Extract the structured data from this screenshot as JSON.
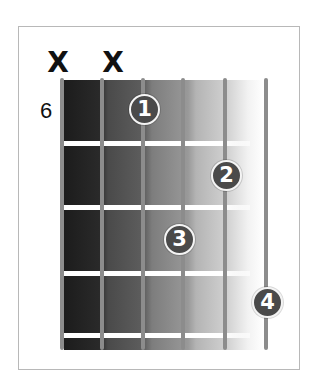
{
  "diagram": {
    "type": "guitar-chord-diagram",
    "starting_fret": "6",
    "string_count": 6,
    "fret_count": 4,
    "muted_strings": [
      {
        "string": 6,
        "symbol": "X"
      },
      {
        "string": 5,
        "symbol": "X"
      }
    ],
    "fingers": [
      {
        "finger": "1",
        "string": 4,
        "fret": 1
      },
      {
        "finger": "2",
        "string": 2,
        "fret": 2
      },
      {
        "finger": "3",
        "string": 3,
        "fret": 3
      },
      {
        "finger": "4",
        "string": 1,
        "fret": 4
      }
    ],
    "colors": {
      "string": "#8c8c8c",
      "finger_dot": "#4a4a4a",
      "finger_text": "#ffffff",
      "fret_gap": "#ffffff",
      "gradient_start": "#1c1c1c",
      "gradient_end": "#ffffff",
      "border": "#b8b8b8"
    }
  }
}
